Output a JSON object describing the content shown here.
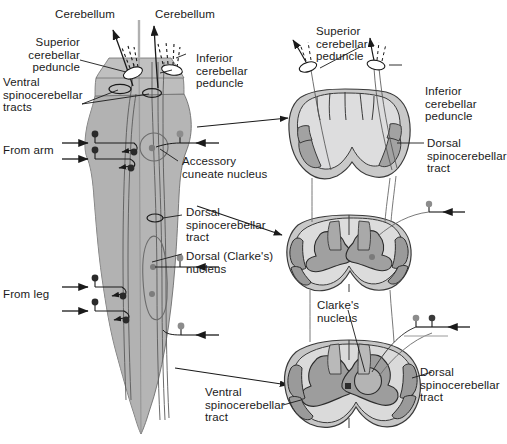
{
  "figure": {
    "colors": {
      "cord_fill": "#b3b3b3",
      "cord_fill_light": "#c6c6c6",
      "white_matter": "#d5d5d5",
      "gray_matter": "#9a9a9a",
      "tract_highlight": "#8f8f8f",
      "outline": "#1a1a1a",
      "neuron_gray": "#8c8c8c",
      "neuron_dark": "#333333",
      "background": "#ffffff"
    }
  },
  "left_panel": {
    "labels": {
      "cerebellum_left": "Cerebellum",
      "cerebellum_right": "Cerebellum",
      "superior_cerebellar_peduncle": "Superior\ncerebellar\npeduncle",
      "inferior_cerebellar_peduncle": "Inferior\ncerebellar\npeduncle",
      "ventral_spinocerebellar_tracts": "Ventral\nspinocerebellar\ntracts",
      "from_arm": "From arm",
      "from_leg": "From leg",
      "accessory_cuneate_nucleus": "Accessory\ncuneate nucleus",
      "dorsal_spinocerebellar_tract": "Dorsal\nspinocerebellar\ntract",
      "dorsal_clarkes_nucleus": "Dorsal (Clarke's)\nnucleus",
      "ventral_spinocerebellar_tract": "Ventral\nspinocerebellar\ntract"
    }
  },
  "right_panel": {
    "labels": {
      "superior_cerebellar_peduncle": "Superior\ncerebellar\npeduncle",
      "inferior_cerebellar_peduncle": "Inferior\ncerebellar\npeduncle",
      "dorsal_spinocerebellar_tract_top": "Dorsal\nspinocerebellar\ntract",
      "clarkes_nucleus": "Clarke's\nnucleus",
      "dorsal_spinocerebellar_tract_bottom": "Dorsal\nspinocerebellar\ntract"
    },
    "sections": [
      {
        "name": "medulla-section",
        "level": "medulla"
      },
      {
        "name": "cervical-cord-section",
        "level": "cervical"
      },
      {
        "name": "lumbar-cord-section",
        "level": "lumbar"
      }
    ]
  }
}
